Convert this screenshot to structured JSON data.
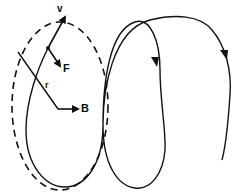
{
  "diagram": {
    "labels": {
      "velocity": "v",
      "force": "F",
      "radius": "r",
      "field": "B"
    },
    "colors": {
      "stroke": "#111111",
      "background": "#ffffff"
    }
  }
}
